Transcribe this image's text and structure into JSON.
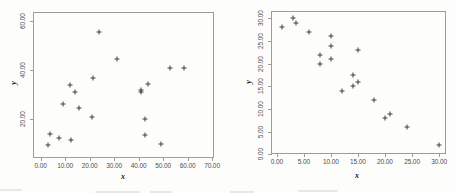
{
  "figure": {
    "background": "#fdfdfc",
    "frame_color": "#9c9c9c",
    "marker_color": "#3c3c3c",
    "tick_label_color": "#4d4d4d",
    "axis_title_color": "#1a1a1a"
  },
  "chart_data": [
    {
      "id": "left-scatter",
      "type": "scatter",
      "title": "",
      "marker": "+",
      "xlabel": "x",
      "ylabel": "y",
      "grid": false,
      "legend": "none",
      "xlim": [
        -2.7,
        70.4
      ],
      "ylim": [
        4.7,
        63.4
      ],
      "xticks": [
        {
          "v": 0,
          "label": "0.00"
        },
        {
          "v": 10,
          "label": "10.00"
        },
        {
          "v": 20,
          "label": "20.00"
        },
        {
          "v": 30,
          "label": "30.00"
        },
        {
          "v": 40,
          "label": "40.00"
        },
        {
          "v": 50,
          "label": "50.00"
        },
        {
          "v": 60,
          "label": "60.00"
        },
        {
          "v": 70,
          "label": "70.00"
        }
      ],
      "yticks": [
        {
          "v": 20,
          "label": "20.00"
        },
        {
          "v": 40,
          "label": "40.00"
        },
        {
          "v": 60,
          "label": "60.00"
        }
      ],
      "points": [
        [
          3,
          9.5
        ],
        [
          4,
          14
        ],
        [
          7.5,
          12.5
        ],
        [
          9,
          26.5
        ],
        [
          12,
          34
        ],
        [
          12.5,
          11.5
        ],
        [
          14,
          31
        ],
        [
          15.5,
          24.5
        ],
        [
          21,
          21
        ],
        [
          21.5,
          37
        ],
        [
          24,
          55.5
        ],
        [
          31,
          44.5
        ],
        [
          41,
          32
        ],
        [
          41,
          31
        ],
        [
          44,
          34.5
        ],
        [
          42.5,
          20
        ],
        [
          42.5,
          13.5
        ],
        [
          49,
          10
        ],
        [
          53,
          41
        ],
        [
          58.5,
          41
        ]
      ]
    },
    {
      "id": "right-scatter",
      "type": "scatter",
      "title": "",
      "marker": "+",
      "xlabel": "x",
      "ylabel": "y",
      "grid": false,
      "legend": "none",
      "xlim": [
        -0.9,
        31.1
      ],
      "ylim": [
        0.3,
        31.4
      ],
      "xticks": [
        {
          "v": 0,
          "label": "0.00"
        },
        {
          "v": 5,
          "label": "5.00"
        },
        {
          "v": 10,
          "label": "10.00"
        },
        {
          "v": 15,
          "label": "15.00"
        },
        {
          "v": 20,
          "label": "20.00"
        },
        {
          "v": 25,
          "label": "25.00"
        },
        {
          "v": 30,
          "label": "30.00"
        }
      ],
      "yticks": [
        {
          "v": 0,
          "label": "0.00"
        },
        {
          "v": 5,
          "label": "5.00"
        },
        {
          "v": 10,
          "label": "10.00"
        },
        {
          "v": 15,
          "label": "15.00"
        },
        {
          "v": 20,
          "label": "20.00"
        },
        {
          "v": 25,
          "label": "25.00"
        },
        {
          "v": 30,
          "label": "30.00"
        }
      ],
      "points": [
        [
          1,
          28
        ],
        [
          3,
          30
        ],
        [
          3.5,
          29
        ],
        [
          6,
          27
        ],
        [
          8,
          22
        ],
        [
          8,
          20
        ],
        [
          10,
          26
        ],
        [
          10,
          24
        ],
        [
          10,
          21
        ],
        [
          12,
          14
        ],
        [
          14,
          17.5
        ],
        [
          14,
          15
        ],
        [
          15,
          23
        ],
        [
          15,
          16
        ],
        [
          18,
          12
        ],
        [
          20,
          8
        ],
        [
          21,
          9
        ],
        [
          24,
          6
        ],
        [
          30,
          2
        ]
      ]
    }
  ]
}
